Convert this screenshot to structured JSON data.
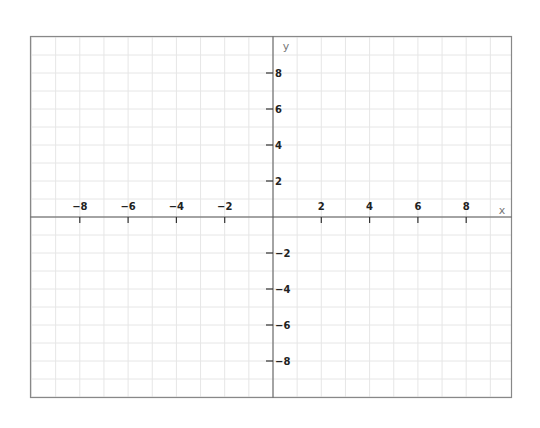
{
  "chart_data": {
    "type": "line",
    "title": "",
    "xlabel": "x",
    "ylabel": "y",
    "xlim": [
      -10,
      9.8
    ],
    "ylim": [
      -10,
      10
    ],
    "grid": true,
    "grid_step": 1,
    "x_ticks": [
      -8,
      -6,
      -4,
      -2,
      2,
      4,
      6,
      8
    ],
    "y_ticks": [
      8,
      6,
      4,
      2,
      -2,
      -4,
      -6,
      -8
    ],
    "x_tick_labels": [
      "−8",
      "−6",
      "−4",
      "−2",
      "2",
      "4",
      "6",
      "8"
    ],
    "y_tick_labels": [
      "8",
      "6",
      "4",
      "2",
      "−2",
      "−4",
      "−6",
      "−8"
    ],
    "series": []
  },
  "colors": {
    "grid": "#e6e6e6",
    "axis": "#555555",
    "border": "#888888",
    "label": "#222222",
    "axis_label": "#777777"
  }
}
